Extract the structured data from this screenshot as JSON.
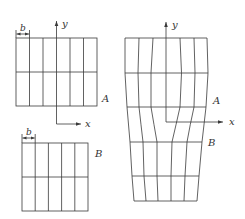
{
  "figure": {
    "labels": {
      "dimension": "b",
      "axis_x": "x",
      "axis_y": "y",
      "region_a": "A",
      "region_b": "B"
    },
    "left_grid_a": {
      "columns": 6,
      "rows": 2
    },
    "left_grid_b": {
      "columns": 5,
      "rows": 2
    },
    "right_grid": {
      "upper_columns": 6,
      "lower_columns": 5,
      "rows": 4
    },
    "colors": {
      "line": "#3a3a3a",
      "text": "#333333",
      "background": "#ffffff"
    }
  }
}
